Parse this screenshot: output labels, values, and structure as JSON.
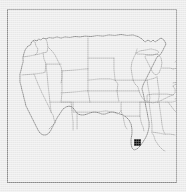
{
  "figure": {
    "type": "map",
    "title": "",
    "projection": "albers-usa-like",
    "background_color": "#ececec",
    "frame": {
      "visible": true,
      "color": "#8d8d8d",
      "line_width_px": 1,
      "x": 7,
      "y": 9,
      "width": 170,
      "height": 174
    },
    "linework": {
      "state_border_color": "#8a8a8a",
      "national_outline_color": "#6e6e6e",
      "state_border_width": 0.55,
      "national_outline_width": 0.75
    },
    "legend": {
      "visible": false,
      "entries": []
    },
    "axis_labels": {
      "visible": false
    },
    "tick_labels": {
      "visible": false
    },
    "annotations": []
  },
  "markers": [
    {
      "id": "marker-florida",
      "label": "",
      "shape": "filled-square",
      "color": "#0a0a0a",
      "region": "Florida",
      "x_px": 134,
      "y_px": 139,
      "width_px": 7,
      "height_px": 7
    }
  ],
  "chart_data": {
    "type": "map",
    "title": "",
    "xlabel": "",
    "ylabel": "",
    "series": [
      {
        "name": "highlighted-location",
        "values": [
          {
            "region": "Florida",
            "marker": "filled-square",
            "color": "#0a0a0a"
          }
        ]
      }
    ],
    "categories": [
      "Florida"
    ],
    "values": [
      1
    ],
    "legend_position": "none",
    "grid": false
  }
}
